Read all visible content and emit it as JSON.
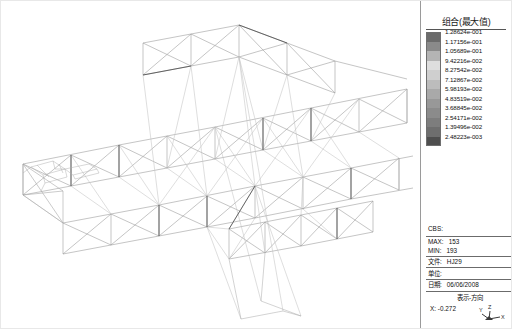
{
  "app": {
    "view_type": "3d-structural-model-viewport"
  },
  "legend": {
    "title": "组合(最大值)",
    "entries": [
      {
        "label": "1.28624e-001",
        "color": "#6b6b6b"
      },
      {
        "label": "1.17156e-001",
        "color": "#8a8a8a"
      },
      {
        "label": "1.05689e-001",
        "color": "#b4b4b4"
      },
      {
        "label": "9.42216e-002",
        "color": "#dedede"
      },
      {
        "label": "8.27542e-002",
        "color": "#cfcfcf"
      },
      {
        "label": "7.12867e-002",
        "color": "#bcbcbc"
      },
      {
        "label": "5.98193e-002",
        "color": "#a9a9a9"
      },
      {
        "label": "4.83519e-002",
        "color": "#989898"
      },
      {
        "label": "3.68845e-002",
        "color": "#8b8b8b"
      },
      {
        "label": "2.54171e-002",
        "color": "#7d7d7d"
      },
      {
        "label": "1.39496e-002",
        "color": "#6e6e6e"
      },
      {
        "label": "2.48223e-003",
        "color": "#4e4e4e"
      }
    ]
  },
  "info": {
    "cbs_label": "CBS:",
    "cbs_value": "",
    "max_label": "MAX:",
    "max_value": "153",
    "min_label": "MIN:",
    "min_value": "193",
    "file_label": "文件:",
    "file_value": "HJ29",
    "unit_label": "单位:",
    "unit_value": "",
    "date_label": "日期:",
    "date_value": "06/06/2008",
    "orientation_title": "表示-方向",
    "orientation_x_label": "X:",
    "orientation_x_value": "-0.272",
    "axis_y": "Y",
    "axis_z": "Z",
    "axis_x": "X"
  },
  "model": {
    "name": "truss-bridge-wireframe",
    "line_color": "#9b9b9b",
    "accent_color": "#555555"
  }
}
